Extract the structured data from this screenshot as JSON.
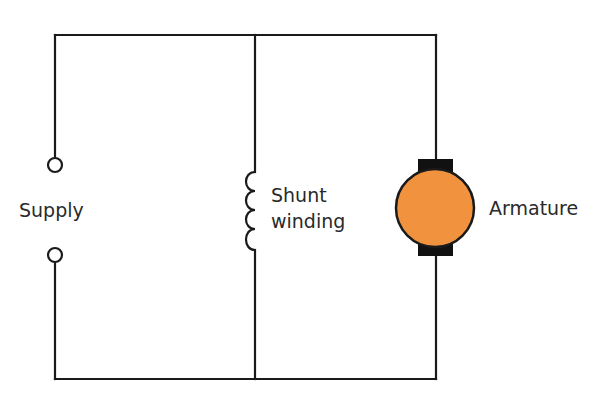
{
  "diagram": {
    "type": "dc-shunt-motor-circuit",
    "labels": {
      "supply": "Supply",
      "shunt_line1": "Shunt",
      "shunt_line2": "winding",
      "armature": "Armature"
    },
    "caption": "",
    "components": [
      {
        "id": "supply",
        "kind": "terminals",
        "count": 2
      },
      {
        "id": "shunt-winding",
        "kind": "inductor-coil",
        "turns": 4
      },
      {
        "id": "armature",
        "kind": "motor-armature",
        "brushes": 2
      }
    ],
    "colors": {
      "wire": "#1a1a1a",
      "armature_fill": "#F0923E",
      "brush": "#111111",
      "text": "#2a2a2a",
      "background": "#ffffff"
    }
  }
}
